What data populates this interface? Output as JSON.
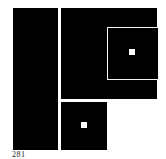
{
  "figure": {
    "caption": "281",
    "colors": {
      "fill": "#000000",
      "background": "#ffffff",
      "accent": "#f4f4f4"
    },
    "shapes": [
      {
        "name": "left-column",
        "type": "rect"
      },
      {
        "name": "upper-right-block",
        "type": "rect"
      },
      {
        "name": "nested-square-upper",
        "type": "outlined-square-with-dot"
      },
      {
        "name": "nested-square-lower",
        "type": "square-with-dot"
      }
    ]
  }
}
